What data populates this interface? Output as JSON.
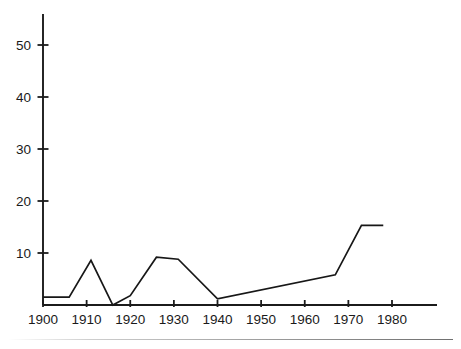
{
  "chart_data": {
    "type": "line",
    "title": "",
    "subtitle": "",
    "xlabel": "",
    "ylabel": "",
    "xlim": [
      1900,
      1985
    ],
    "ylim": [
      0,
      58
    ],
    "grid": false,
    "legend": "none",
    "axis_style": "left y-axis and bottom x-axis only, outward ticks",
    "line_color": "#171717",
    "x_ticks": [
      1900,
      1910,
      1920,
      1930,
      1940,
      1950,
      1960,
      1970,
      1980
    ],
    "x_tick_labels": [
      "1900",
      "1910",
      "1920",
      "1930",
      "1940",
      "1950",
      "1960",
      "1970",
      "1980"
    ],
    "y_ticks": [
      10,
      20,
      30,
      40,
      50
    ],
    "y_tick_labels": [
      "10",
      "20",
      "30",
      "40",
      "50"
    ],
    "series": [
      {
        "name": "series-1",
        "x": [
          1900,
          1906,
          1911,
          1916,
          1920,
          1926,
          1931,
          1940,
          1967,
          1973,
          1978
        ],
        "values": [
          1.5,
          1.5,
          8.6,
          0.0,
          1.8,
          9.2,
          8.8,
          1.2,
          5.8,
          15.3,
          15.3
        ]
      }
    ]
  },
  "footer": {
    "rule": ""
  }
}
